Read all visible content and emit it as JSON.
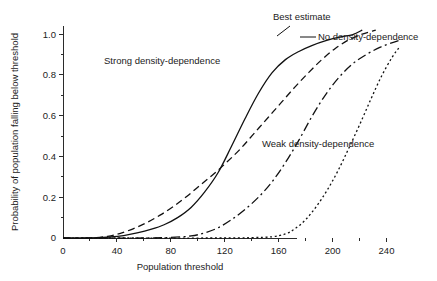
{
  "figure": {
    "clipped_top_caption": "",
    "background_color": "#ffffff",
    "ink_color": "#111111"
  },
  "chart_data": {
    "type": "line",
    "title": "",
    "xlabel": "Population threshold",
    "ylabel": "Probability of population falling below threshold",
    "xlim": [
      0,
      250
    ],
    "ylim": [
      0,
      1.04
    ],
    "grid": false,
    "legend_position": "inline-annotations",
    "x_ticks_major": [
      0,
      40,
      80,
      120,
      160,
      200,
      240
    ],
    "x_ticks_minor": [
      20,
      60,
      100,
      140,
      180,
      220
    ],
    "y_ticks_major": [
      0,
      0.2,
      0.4,
      0.6,
      0.8,
      1.0
    ],
    "y_ticks_minor": [
      0.1,
      0.3,
      0.5,
      0.7,
      0.9
    ],
    "x_tick_labels": [
      "0",
      "40",
      "80",
      "120",
      "160",
      "200",
      "240"
    ],
    "y_tick_labels": [
      "0",
      "0.2",
      "0.4",
      "0.6",
      "0.8",
      "1.0"
    ],
    "series": [
      {
        "name": "Strong density-dependence",
        "label": "Strong density-dependence",
        "style": "solid",
        "dasharray": "",
        "label_x": 104,
        "label_y": 64,
        "x": [
          0,
          20,
          35,
          45,
          55,
          65,
          75,
          85,
          95,
          105,
          115,
          125,
          135,
          145,
          155,
          165,
          175,
          185,
          195,
          205,
          215,
          222
        ],
        "y": [
          0.0,
          0.0,
          0.005,
          0.012,
          0.025,
          0.042,
          0.065,
          0.1,
          0.15,
          0.225,
          0.32,
          0.45,
          0.585,
          0.71,
          0.81,
          0.875,
          0.915,
          0.945,
          0.968,
          0.985,
          0.998,
          1.02
        ]
      },
      {
        "name": "Best estimate",
        "label": "Best estimate",
        "style": "dashed",
        "dasharray": "7,4",
        "label_x": 273,
        "label_y": 20,
        "leader": {
          "x1": 290,
          "y1": 26,
          "x2": 277,
          "y2": 36
        },
        "x": [
          0,
          20,
          33,
          42,
          52,
          62,
          72,
          82,
          92,
          102,
          112,
          122,
          132,
          142,
          152,
          162,
          172,
          182,
          192,
          202,
          212,
          222,
          232
        ],
        "y": [
          0.0,
          0.0,
          0.008,
          0.022,
          0.045,
          0.075,
          0.112,
          0.155,
          0.205,
          0.26,
          0.315,
          0.375,
          0.44,
          0.515,
          0.59,
          0.665,
          0.74,
          0.81,
          0.875,
          0.93,
          0.972,
          1.0,
          1.02
        ]
      },
      {
        "name": "No density-dependence",
        "label": "No density-dependence",
        "style": "dashdot",
        "dasharray": "9,3.5,2,3.5",
        "label_x": 318,
        "label_y": 40,
        "leader": {
          "x1": 316,
          "y1": 37,
          "x2": 300,
          "y2": 37
        },
        "x": [
          0,
          60,
          80,
          95,
          105,
          115,
          125,
          135,
          145,
          155,
          165,
          175,
          185,
          195,
          205,
          215,
          225,
          235,
          245,
          252
        ],
        "y": [
          0.0,
          0.0,
          0.003,
          0.01,
          0.025,
          0.05,
          0.09,
          0.14,
          0.2,
          0.275,
          0.37,
          0.48,
          0.6,
          0.705,
          0.79,
          0.855,
          0.9,
          0.935,
          0.96,
          0.975
        ]
      },
      {
        "name": "Weak density-dependence",
        "label": "Weak density-dependence",
        "style": "dotted",
        "dasharray": "2,2.6",
        "label_x": 262,
        "label_y": 147,
        "x": [
          0,
          120,
          140,
          155,
          165,
          172,
          180,
          188,
          196,
          204,
          212,
          220,
          228,
          236,
          244,
          250
        ],
        "y": [
          0.0,
          0.0,
          0.002,
          0.006,
          0.02,
          0.045,
          0.09,
          0.155,
          0.235,
          0.33,
          0.44,
          0.555,
          0.675,
          0.79,
          0.885,
          0.94
        ]
      }
    ]
  },
  "axes_geometry": {
    "plot_left_px": 63,
    "plot_right_px": 400,
    "plot_bottom_px": 238,
    "plot_top_px": 26,
    "x_axis_end_value": 250,
    "y_axis_top_value": 1.04,
    "x_spine_right_px": 297,
    "major_tick_len": 4,
    "minor_tick_len": 2.5
  }
}
